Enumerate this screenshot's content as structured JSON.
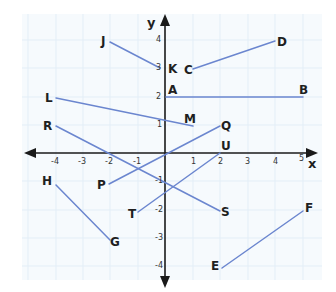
{
  "diagram": {
    "type": "coordinate-plane",
    "axes": {
      "x_label": "x",
      "y_label": "y",
      "x_ticks": [
        "-4",
        "-3",
        "-2",
        "-1",
        "1",
        "2",
        "3",
        "4",
        "5"
      ],
      "y_ticks": [
        "4",
        "3",
        "2",
        "1",
        "-1",
        "-2",
        "-3",
        "-4"
      ]
    },
    "colors": {
      "grid": "#e3eef7",
      "grid_bg": "#f6fafd",
      "axis": "#1a1a1a",
      "segment": "#6b86cf",
      "label": "#1f1f1f"
    },
    "points": {
      "A": "A",
      "B": "B",
      "C": "C",
      "D": "D",
      "E": "E",
      "F": "F",
      "G": "G",
      "H": "H",
      "J": "J",
      "K": "K",
      "L": "L",
      "M": "M",
      "P": "P",
      "Q": "Q",
      "R": "R",
      "S": "S",
      "T": "T",
      "U": "U"
    },
    "segments": [
      {
        "name": "JK",
        "from": "J",
        "to": "K",
        "from_xy": [
          -2.2,
          4.2
        ],
        "to_xy": [
          0,
          3
        ]
      },
      {
        "name": "CD",
        "from": "C",
        "to": "D",
        "from_xy": [
          0.8,
          3
        ],
        "to_xy": [
          4,
          4
        ]
      },
      {
        "name": "AB",
        "from": "A",
        "to": "B",
        "from_xy": [
          0,
          2
        ],
        "to_xy": [
          5,
          2
        ]
      },
      {
        "name": "LM",
        "from": "L",
        "to": "M",
        "from_xy": [
          -4,
          2
        ],
        "to_xy": [
          1,
          1
        ]
      },
      {
        "name": "RS",
        "from": "R",
        "to": "S",
        "from_xy": [
          -4,
          1
        ],
        "to_xy": [
          2,
          -2
        ]
      },
      {
        "name": "PQ",
        "from": "P",
        "to": "Q",
        "from_xy": [
          -2,
          -1
        ],
        "to_xy": [
          2,
          1
        ]
      },
      {
        "name": "TU",
        "from": "T",
        "to": "U",
        "from_xy": [
          -1,
          -2
        ],
        "to_xy": [
          2,
          0
        ]
      },
      {
        "name": "HG",
        "from": "H",
        "to": "G",
        "from_xy": [
          -4,
          -1
        ],
        "to_xy": [
          -2,
          -3
        ]
      },
      {
        "name": "EF",
        "from": "E",
        "to": "F",
        "from_xy": [
          2,
          -4
        ],
        "to_xy": [
          5,
          -1.5
        ]
      }
    ]
  }
}
